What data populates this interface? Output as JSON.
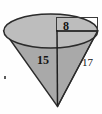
{
  "figure": {
    "name": "cone-with-dimensions",
    "shape": "cone",
    "orientation": "apex-down",
    "background_color": "#fefefe",
    "colors": {
      "top_ellipse_fill": "#bdbdbd",
      "cone_body_fill": "#a9a9a9",
      "outline": "#2b2b2b",
      "label_text": "#141414",
      "rect_outline": "#3a3a3a"
    },
    "labels": {
      "radius": "8",
      "height": "15",
      "slant": "17"
    },
    "label_meanings": {
      "radius": "radius of circular top",
      "height": "vertical height of cone",
      "slant": "slant height of cone"
    },
    "annotation_box": {
      "name": "radius-dimension-box",
      "description": "thin rectangle outline at upper right enclosing the radius label"
    },
    "artifact": {
      "name": "scan-speck",
      "description": "small dark scan speck at lower left"
    }
  }
}
